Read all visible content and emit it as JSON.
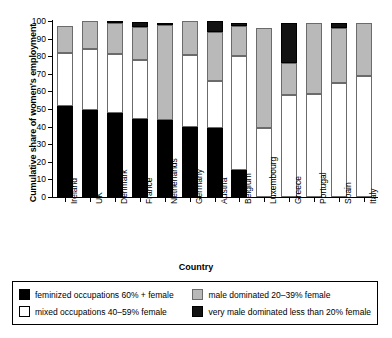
{
  "chart_data": {
    "type": "bar",
    "stacked": true,
    "title": "",
    "xlabel": "Country",
    "ylabel": "Cumulative share of women's employment",
    "ylim": [
      0,
      100
    ],
    "yticks": [
      0,
      10,
      20,
      30,
      40,
      50,
      60,
      70,
      80,
      90,
      100
    ],
    "grid": false,
    "legend_position": "bottom",
    "categories": [
      "Ireland",
      "UK",
      "Denmark",
      "France",
      "Netherlands",
      "Germany",
      "Austria",
      "Belgium",
      "Luxembourg",
      "Greece",
      "Portugal",
      "Spain",
      "Italy"
    ],
    "series": [
      {
        "name": "feminized occupations 60% + female",
        "color": "#000000",
        "values": [
          51.5,
          49.5,
          47.5,
          44.5,
          44,
          39.5,
          39,
          15.5,
          0,
          0,
          0,
          0,
          0
        ]
      },
      {
        "name": "mixed occupations 40-59% female",
        "color": "#ffffff",
        "values": [
          30.5,
          34.5,
          33.5,
          33.5,
          0,
          41,
          27,
          64.5,
          39,
          58,
          58.5,
          65,
          69
        ]
      },
      {
        "name": "male dominated 20-39% female",
        "color": "#b9b9b9",
        "values": [
          15,
          16,
          18,
          18.5,
          54,
          19.5,
          28,
          17,
          57,
          18,
          40.5,
          31,
          30
        ]
      },
      {
        "name": "very male dominated less than 20% female",
        "color": "#121212",
        "values": [
          0,
          0,
          1,
          3,
          1,
          0,
          6,
          2,
          0,
          23,
          0,
          3,
          0
        ]
      }
    ],
    "cumulative_tops": {
      "Ireland": [
        51.5,
        82,
        97,
        97
      ],
      "UK": [
        49.5,
        84,
        100,
        100
      ],
      "Denmark": [
        47.5,
        81,
        99,
        100
      ],
      "France": [
        44.5,
        78,
        96.5,
        99.5
      ],
      "Netherlands": [
        44,
        44,
        98,
        99
      ],
      "Germany": [
        39.5,
        80.5,
        100,
        100
      ],
      "Austria": [
        39,
        66,
        94,
        100
      ],
      "Belgium": [
        15.5,
        80,
        97,
        99
      ],
      "Luxembourg": [
        0,
        39,
        96,
        96
      ],
      "Greece": [
        0,
        58,
        76,
        99
      ],
      "Portugal": [
        0,
        58.5,
        99,
        99
      ],
      "Spain": [
        0,
        65,
        96,
        99
      ],
      "Italy": [
        0,
        69,
        99,
        99
      ]
    }
  },
  "axis": {
    "ylabel": "Cumulative share of women's employment",
    "xlabel": "Country"
  },
  "legend": {
    "items": [
      {
        "label": "feminized occupations 60% + female",
        "swatch": "fem"
      },
      {
        "label": "male dominated 20–39% female",
        "swatch": "mal"
      },
      {
        "label": "mixed occupations 40–59% female",
        "swatch": "mix"
      },
      {
        "label": "very male dominated less than 20% female",
        "swatch": "vmal"
      }
    ]
  }
}
